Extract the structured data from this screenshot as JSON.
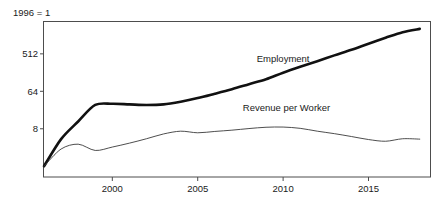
{
  "chart_data": {
    "type": "line",
    "title": "",
    "subtitle": "",
    "unit_note": "1996 = 1",
    "xlabel": "",
    "ylabel": "",
    "yscale": "log",
    "ylim": [
      0.55,
      3000
    ],
    "xlim": [
      1996,
      2018.6
    ],
    "grid": false,
    "legend": "inline-annotation",
    "ytick_labels": [
      "512",
      "64",
      "8"
    ],
    "ytick_values": [
      512,
      64,
      8
    ],
    "xtick_labels": [
      "2000",
      "2005",
      "2010",
      "2015"
    ],
    "xtick_values": [
      2000,
      2005,
      2010,
      2015
    ],
    "x": [
      1996,
      1997,
      1998,
      1999,
      2000,
      2001,
      2002,
      2003,
      2004,
      2005,
      2006,
      2007,
      2008,
      2009,
      2010,
      2011,
      2012,
      2013,
      2014,
      2015,
      2016,
      2017,
      2018
    ],
    "series": [
      {
        "name": "Employment",
        "style": "thick",
        "color": "#111111",
        "label_x": 2010.0,
        "label_y": 330,
        "values": [
          1,
          4.5,
          12,
          30,
          32,
          31,
          30,
          31,
          36,
          44,
          56,
          72,
          95,
          125,
          180,
          250,
          340,
          470,
          640,
          900,
          1250,
          1700,
          2050
        ]
      },
      {
        "name": "Revenue per Worker",
        "style": "thin",
        "color": "#3a3a3a",
        "label_x": 2010.2,
        "label_y": 22,
        "values": [
          1,
          2.6,
          3.4,
          2.4,
          2.9,
          3.6,
          4.6,
          6.0,
          7.0,
          6.4,
          6.9,
          7.4,
          8.1,
          8.7,
          8.8,
          8.2,
          7.0,
          6.1,
          5.2,
          4.4,
          4.0,
          4.6,
          4.5
        ]
      }
    ]
  },
  "axis": {
    "frame_color": "#4d4d4d"
  }
}
